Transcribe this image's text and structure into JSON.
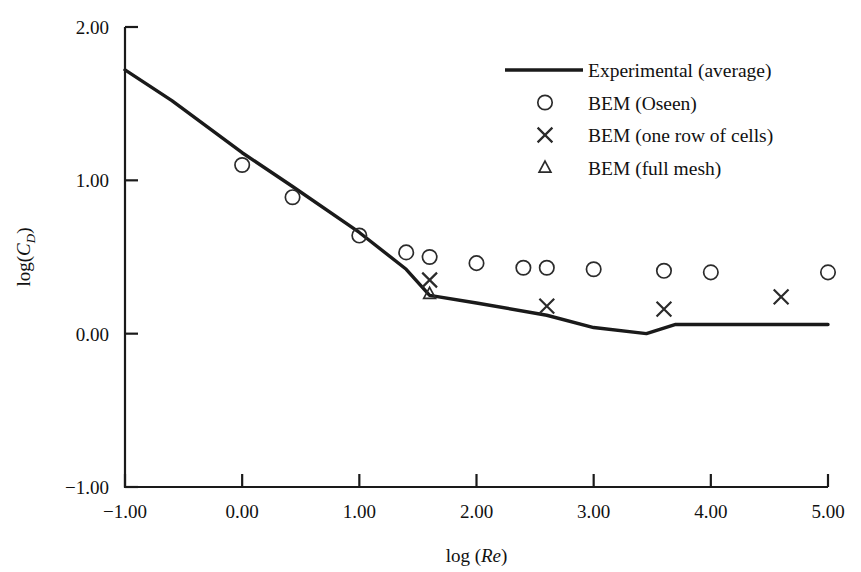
{
  "chart_data": {
    "type": "scatter",
    "title": "",
    "xlabel": "log (Re)",
    "ylabel": "log(C_D)",
    "xlim": [
      -1.0,
      5.0
    ],
    "ylim": [
      -1.0,
      2.0
    ],
    "xticks": [
      -1.0,
      0.0,
      1.0,
      2.0,
      3.0,
      4.0,
      5.0
    ],
    "xtick_labels": [
      "-1.00",
      "0.00",
      "1.00",
      "2.00",
      "3.00",
      "4.00",
      "5.00"
    ],
    "yticks": [
      -1.0,
      0.0,
      1.0,
      2.0
    ],
    "ytick_labels": [
      "-1.00",
      "0.00",
      "1.00",
      "2.00"
    ],
    "grid": false,
    "legend_position": "upper-right",
    "series": [
      {
        "name": "Experimental (average)",
        "marker": "line",
        "type": "line",
        "x": [
          -1.0,
          -0.6,
          0.0,
          0.43,
          1.0,
          1.4,
          1.6,
          2.0,
          2.6,
          3.0,
          3.45,
          3.7,
          4.0,
          5.0
        ],
        "y": [
          1.72,
          1.52,
          1.18,
          0.96,
          0.66,
          0.42,
          0.25,
          0.2,
          0.12,
          0.04,
          0.0,
          0.06,
          0.06,
          0.06
        ]
      },
      {
        "name": "BEM (Oseen)",
        "marker": "circle",
        "type": "scatter",
        "x": [
          0.0,
          0.43,
          1.0,
          1.4,
          1.6,
          2.0,
          2.4,
          2.6,
          3.0,
          3.6,
          4.0,
          5.0
        ],
        "y": [
          1.1,
          0.89,
          0.64,
          0.53,
          0.5,
          0.46,
          0.43,
          0.43,
          0.42,
          0.41,
          0.4,
          0.4
        ]
      },
      {
        "name": "BEM (one row of cells)",
        "marker": "cross",
        "type": "scatter",
        "x": [
          1.6,
          2.6,
          3.6,
          4.6
        ],
        "y": [
          0.35,
          0.18,
          0.16,
          0.24
        ]
      },
      {
        "name": "BEM (full mesh)",
        "marker": "triangle",
        "type": "scatter",
        "x": [
          1.6
        ],
        "y": [
          0.26
        ]
      }
    ]
  },
  "axes": {
    "y_label_prefix": "log(",
    "y_label_var": "C",
    "y_label_sub": "D",
    "y_label_suffix": ")",
    "x_label_prefix": "log (",
    "x_label_var": "Re",
    "x_label_suffix": ")"
  },
  "legend": {
    "entries": [
      {
        "label": "Experimental (average)",
        "marker": "line"
      },
      {
        "label": "BEM (Oseen)",
        "marker": "circle"
      },
      {
        "label": "BEM (one row of cells)",
        "marker": "cross"
      },
      {
        "label": "BEM (full mesh)",
        "marker": "triangle"
      }
    ]
  },
  "style": {
    "line_color": "#1a1a1a",
    "marker_color": "#2b2b2b",
    "axis_color": "#1a1a1a",
    "background": "#ffffff"
  }
}
